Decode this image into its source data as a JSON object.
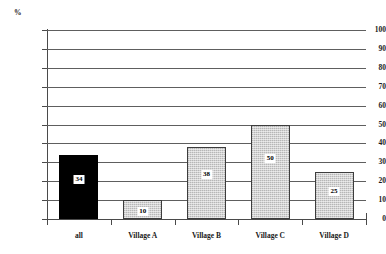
{
  "chart_data": {
    "type": "bar",
    "title": "",
    "subtitle": "",
    "xlabel": "",
    "ylabel": "%",
    "unit_caption": "%",
    "categories": [
      "all",
      "Village A",
      "Village B",
      "Village C",
      "Village D"
    ],
    "values": [
      34,
      10,
      38,
      50,
      25
    ],
    "data_labels": [
      "34",
      "10",
      "38",
      "50",
      "25"
    ],
    "series": [
      {
        "name": "percentage",
        "values": [
          34,
          10,
          38,
          50,
          25
        ]
      }
    ],
    "ylim": [
      0,
      100
    ],
    "ytick_values": [
      0,
      10,
      20,
      30,
      40,
      50,
      60,
      70,
      80,
      90,
      100
    ],
    "ytick_labels": [
      "0",
      "10",
      "20",
      "30",
      "40",
      "50",
      "60",
      "70",
      "80",
      "90",
      "100"
    ],
    "grid": "horizontal",
    "legend": "none",
    "legend_position": "none",
    "bar_styles": [
      "solid-black",
      "hatched-gray",
      "hatched-gray",
      "hatched-gray",
      "hatched-gray"
    ],
    "colors": {
      "bar_highlight": "#000000",
      "bar_default": "#d2d2d2",
      "bar_outline": "#3d3d3d",
      "gridline": "#5e5e5e",
      "axis": "#4a4a4a",
      "text": "#1a1a1a",
      "background": "#ffffff",
      "label_box": "#ffffff"
    }
  }
}
